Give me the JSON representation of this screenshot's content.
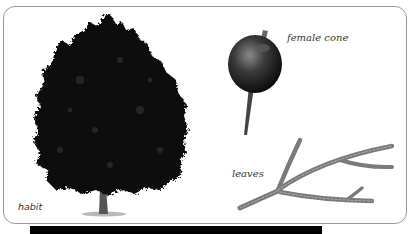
{
  "figure": {
    "panels": [
      {
        "id": "habit",
        "label": "habit",
        "subject": "tree-silhouette"
      },
      {
        "id": "female_cone",
        "label": "female cone",
        "subject": "round-cone-on-stalk"
      },
      {
        "id": "leaves",
        "label": "leaves",
        "subject": "scale-leaf-branchlet"
      }
    ],
    "footer_bar": {
      "text": "",
      "note": "text cut off at image edge"
    }
  },
  "colors": {
    "frame_border": "#9a9a9a",
    "foliage": "#111111",
    "cone": "#2e2e2e",
    "leaves": "#7a7a7a",
    "label_text": "#333333",
    "footer_bar": "#000000"
  }
}
